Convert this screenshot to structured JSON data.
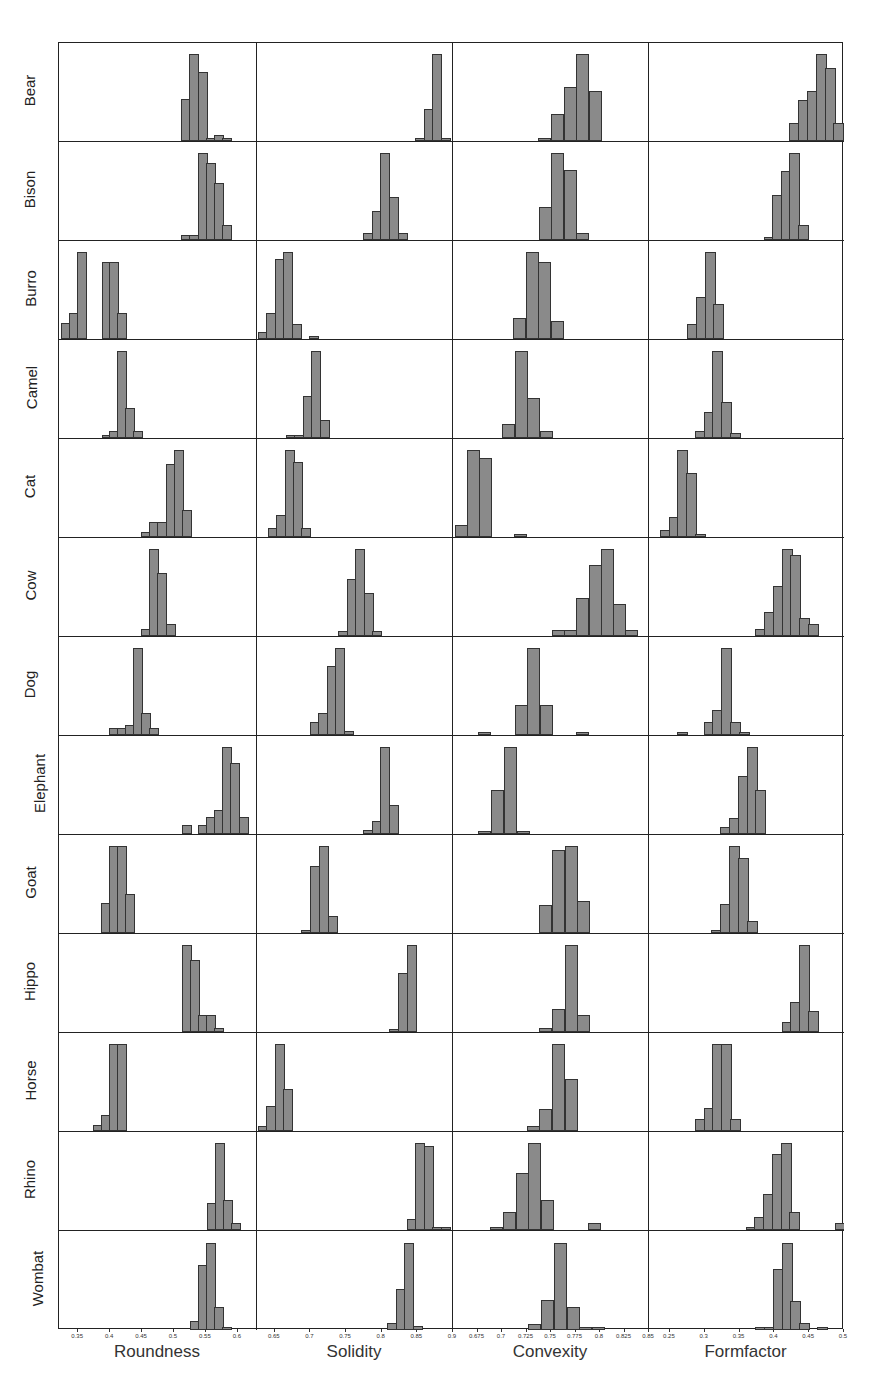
{
  "chart_data": {
    "type": "histogram-grid",
    "title": "",
    "rows": [
      "Bear",
      "Bison",
      "Burro",
      "Camel",
      "Cat",
      "Cow",
      "Dog",
      "Elephant",
      "Goat",
      "Hippo",
      "Horse",
      "Rhino",
      "Wombat"
    ],
    "columns": [
      {
        "name": "Roundness",
        "xlabel": "Roundness",
        "xlim": [
          0.32,
          0.63
        ],
        "ticks": [
          0.35,
          0.4,
          0.45,
          0.5,
          0.55,
          0.6
        ],
        "tick_labels": [
          "0.35",
          "0.4",
          "0.45",
          "0.5",
          "0.55",
          "0.6"
        ]
      },
      {
        "name": "Solidity",
        "xlabel": "Solidity",
        "xlim": [
          0.625,
          0.9
        ],
        "ticks": [
          0.65,
          0.7,
          0.75,
          0.8,
          0.85,
          0.9
        ],
        "tick_labels": [
          "0.65",
          "0.7",
          "0.75",
          "0.8",
          "0.85",
          "0.9"
        ]
      },
      {
        "name": "Convexity",
        "xlabel": "Convexity",
        "xlim": [
          0.65,
          0.85
        ],
        "ticks": [
          0.675,
          0.7,
          0.725,
          0.75,
          0.775,
          0.8,
          0.825,
          0.85
        ],
        "tick_labels": [
          "0.675",
          "0.7",
          "0.725",
          "0.75",
          "0.775",
          "0.8",
          "0.825",
          "0.85"
        ]
      },
      {
        "name": "Formfactor",
        "xlabel": "Formfactor",
        "xlim": [
          0.22,
          0.5
        ],
        "ticks": [
          0.25,
          0.3,
          0.35,
          0.4,
          0.45,
          0.5
        ],
        "tick_labels": [
          "0.25",
          "0.3",
          "0.35",
          "0.4",
          "0.45",
          "0.5"
        ]
      }
    ],
    "bin_width_px": 8,
    "note": "Each histogram listed as bars: [left-x fraction of panel width, relative height 0-1]",
    "histograms": {
      "Bear": [
        [
          [
            0.617,
            0.48
          ],
          [
            0.658,
            1.0
          ],
          [
            0.7,
            0.79
          ],
          [
            0.742,
            0.04
          ],
          [
            0.783,
            0.07
          ],
          [
            0.825,
            0.04
          ]
        ],
        [
          [
            0.805,
            0.04
          ],
          [
            0.85,
            0.37
          ],
          [
            0.895,
            1.0
          ],
          [
            0.94,
            0.04
          ]
        ],
        [
          [
            0.435,
            0.04
          ],
          [
            0.5,
            0.31
          ],
          [
            0.565,
            0.62
          ],
          [
            0.63,
            1.0
          ],
          [
            0.695,
            0.58
          ]
        ],
        [
          [
            0.72,
            0.21
          ],
          [
            0.765,
            0.47
          ],
          [
            0.81,
            0.58
          ],
          [
            0.855,
            1.0
          ],
          [
            0.9,
            0.84
          ],
          [
            0.945,
            0.21
          ]
        ]
      ],
      "Bison": [
        [
          [
            0.617,
            0.06
          ],
          [
            0.658,
            0.06
          ],
          [
            0.7,
            1.0
          ],
          [
            0.742,
            0.88
          ],
          [
            0.783,
            0.65
          ],
          [
            0.825,
            0.17
          ]
        ],
        [
          [
            0.54,
            0.08
          ],
          [
            0.585,
            0.33
          ],
          [
            0.63,
            1.0
          ],
          [
            0.675,
            0.49
          ],
          [
            0.72,
            0.08
          ]
        ],
        [
          [
            0.44,
            0.38
          ],
          [
            0.5,
            1.0
          ],
          [
            0.565,
            0.81
          ],
          [
            0.63,
            0.08
          ]
        ],
        [
          [
            0.59,
            0.04
          ],
          [
            0.633,
            0.52
          ],
          [
            0.676,
            0.79
          ],
          [
            0.719,
            1.0
          ],
          [
            0.762,
            0.17
          ]
        ]
      ],
      "Burro": [
        [
          [
            0.01,
            0.18
          ],
          [
            0.05,
            0.3
          ],
          [
            0.09,
            1.0
          ],
          [
            0.215,
            0.89
          ],
          [
            0.255,
            0.89
          ],
          [
            0.295,
            0.3
          ]
        ],
        [
          [
            0.005,
            0.08
          ],
          [
            0.048,
            0.3
          ],
          [
            0.091,
            0.92
          ],
          [
            0.134,
            1.0
          ],
          [
            0.177,
            0.17
          ],
          [
            0.267,
            0.04
          ]
        ],
        [
          [
            0.305,
            0.24
          ],
          [
            0.37,
            1.0
          ],
          [
            0.435,
            0.89
          ],
          [
            0.5,
            0.21
          ]
        ],
        [
          [
            0.195,
            0.17
          ],
          [
            0.24,
            0.48
          ],
          [
            0.285,
            1.0
          ],
          [
            0.33,
            0.4
          ]
        ]
      ],
      "Camel": [
        [
          [
            0.215,
            0.04
          ],
          [
            0.255,
            0.08
          ],
          [
            0.295,
            1.0
          ],
          [
            0.335,
            0.35
          ],
          [
            0.375,
            0.08
          ]
        ],
        [
          [
            0.148,
            0.04
          ],
          [
            0.191,
            0.04
          ],
          [
            0.234,
            0.48
          ],
          [
            0.277,
            1.0
          ],
          [
            0.32,
            0.21
          ]
        ],
        [
          [
            0.25,
            0.16
          ],
          [
            0.315,
            1.0
          ],
          [
            0.38,
            0.46
          ],
          [
            0.445,
            0.08
          ]
        ],
        [
          [
            0.235,
            0.08
          ],
          [
            0.28,
            0.3
          ],
          [
            0.325,
            1.0
          ],
          [
            0.37,
            0.41
          ],
          [
            0.415,
            0.06
          ]
        ]
      ],
      "Cat": [
        [
          [
            0.415,
            0.06
          ],
          [
            0.456,
            0.17
          ],
          [
            0.497,
            0.17
          ],
          [
            0.538,
            0.84
          ],
          [
            0.579,
            1.0
          ],
          [
            0.62,
            0.31
          ]
        ],
        [
          [
            0.055,
            0.1
          ],
          [
            0.098,
            0.25
          ],
          [
            0.141,
            1.0
          ],
          [
            0.184,
            0.86
          ],
          [
            0.227,
            0.1
          ]
        ],
        [
          [
            0.01,
            0.14
          ],
          [
            0.07,
            1.0
          ],
          [
            0.135,
            0.91
          ],
          [
            0.31,
            0.04
          ]
        ],
        [
          [
            0.055,
            0.08
          ],
          [
            0.1,
            0.23
          ],
          [
            0.145,
            1.0
          ],
          [
            0.19,
            0.74
          ],
          [
            0.235,
            0.04
          ]
        ]
      ],
      "Cow": [
        [
          [
            0.415,
            0.08
          ],
          [
            0.456,
            1.0
          ],
          [
            0.497,
            0.73
          ],
          [
            0.538,
            0.14
          ]
        ],
        [
          [
            0.415,
            0.06
          ],
          [
            0.458,
            0.66
          ],
          [
            0.501,
            1.0
          ],
          [
            0.544,
            0.5
          ],
          [
            0.587,
            0.06
          ]
        ],
        [
          [
            0.505,
            0.07
          ],
          [
            0.568,
            0.07
          ],
          [
            0.63,
            0.44
          ],
          [
            0.692,
            0.82
          ],
          [
            0.755,
            1.0
          ],
          [
            0.818,
            0.37
          ],
          [
            0.88,
            0.07
          ]
        ],
        [
          [
            0.545,
            0.08
          ],
          [
            0.59,
            0.28
          ],
          [
            0.635,
            0.57
          ],
          [
            0.68,
            1.0
          ],
          [
            0.725,
            0.93
          ],
          [
            0.77,
            0.21
          ],
          [
            0.815,
            0.14
          ]
        ]
      ],
      "Dog": [
        [
          [
            0.25,
            0.08
          ],
          [
            0.291,
            0.08
          ],
          [
            0.332,
            0.11
          ],
          [
            0.373,
            1.0
          ],
          [
            0.414,
            0.25
          ],
          [
            0.455,
            0.08
          ]
        ],
        [
          [
            0.27,
            0.15
          ],
          [
            0.313,
            0.25
          ],
          [
            0.356,
            0.79
          ],
          [
            0.399,
            1.0
          ],
          [
            0.442,
            0.05
          ]
        ],
        [
          [
            0.13,
            0.04
          ],
          [
            0.315,
            0.35
          ],
          [
            0.38,
            1.0
          ],
          [
            0.445,
            0.35
          ],
          [
            0.625,
            0.04
          ]
        ],
        [
          [
            0.145,
            0.04
          ],
          [
            0.28,
            0.15
          ],
          [
            0.325,
            0.29
          ],
          [
            0.37,
            1.0
          ],
          [
            0.415,
            0.15
          ],
          [
            0.46,
            0.04
          ]
        ]
      ],
      "Elephant": [
        [
          [
            0.62,
            0.1
          ],
          [
            0.702,
            0.1
          ],
          [
            0.743,
            0.19
          ],
          [
            0.784,
            0.28
          ],
          [
            0.825,
            1.0
          ],
          [
            0.866,
            0.82
          ],
          [
            0.907,
            0.19
          ]
        ],
        [
          [
            0.54,
            0.05
          ],
          [
            0.585,
            0.15
          ],
          [
            0.63,
            1.0
          ],
          [
            0.675,
            0.33
          ]
        ],
        [
          [
            0.13,
            0.04
          ],
          [
            0.195,
            0.51
          ],
          [
            0.26,
            1.0
          ],
          [
            0.325,
            0.04
          ]
        ],
        [
          [
            0.365,
            0.08
          ],
          [
            0.41,
            0.18
          ],
          [
            0.455,
            0.67
          ],
          [
            0.5,
            1.0
          ],
          [
            0.545,
            0.51
          ]
        ]
      ],
      "Goat": [
        [
          [
            0.21,
            0.34
          ],
          [
            0.251,
            1.0
          ],
          [
            0.292,
            1.0
          ],
          [
            0.333,
            0.45
          ]
        ],
        [
          [
            0.225,
            0.04
          ],
          [
            0.27,
            0.77
          ],
          [
            0.315,
            1.0
          ],
          [
            0.36,
            0.2
          ]
        ],
        [
          [
            0.44,
            0.32
          ],
          [
            0.505,
            0.95
          ],
          [
            0.57,
            1.0
          ],
          [
            0.635,
            0.37
          ]
        ],
        [
          [
            0.32,
            0.04
          ],
          [
            0.365,
            0.33
          ],
          [
            0.41,
            1.0
          ],
          [
            0.455,
            0.86
          ],
          [
            0.5,
            0.14
          ]
        ]
      ],
      "Hippo": [
        [
          [
            0.62,
            1.0
          ],
          [
            0.661,
            0.83
          ],
          [
            0.702,
            0.19
          ],
          [
            0.743,
            0.19
          ],
          [
            0.784,
            0.05
          ]
        ],
        [
          [
            0.675,
            0.04
          ],
          [
            0.72,
            0.68
          ],
          [
            0.765,
            1.0
          ]
        ],
        [
          [
            0.44,
            0.05
          ],
          [
            0.505,
            0.27
          ],
          [
            0.57,
            1.0
          ],
          [
            0.635,
            0.19
          ]
        ],
        [
          [
            0.68,
            0.11
          ],
          [
            0.725,
            0.34
          ],
          [
            0.77,
            1.0
          ],
          [
            0.815,
            0.24
          ]
        ]
      ],
      "Horse": [
        [
          [
            0.17,
            0.07
          ],
          [
            0.211,
            0.18
          ],
          [
            0.252,
            1.0
          ],
          [
            0.293,
            1.0
          ]
        ],
        [
          [
            0.005,
            0.06
          ],
          [
            0.048,
            0.29
          ],
          [
            0.091,
            1.0
          ],
          [
            0.134,
            0.48
          ]
        ],
        [
          [
            0.375,
            0.06
          ],
          [
            0.44,
            0.25
          ],
          [
            0.505,
            1.0
          ],
          [
            0.57,
            0.6
          ]
        ],
        [
          [
            0.235,
            0.14
          ],
          [
            0.28,
            0.27
          ],
          [
            0.325,
            1.0
          ],
          [
            0.37,
            1.0
          ],
          [
            0.415,
            0.14
          ]
        ]
      ],
      "Rhino": [
        [
          [
            0.745,
            0.31
          ],
          [
            0.786,
            1.0
          ],
          [
            0.827,
            0.34
          ],
          [
            0.868,
            0.08
          ]
        ],
        [
          [
            0.765,
            0.13
          ],
          [
            0.808,
            1.0
          ],
          [
            0.851,
            0.97
          ],
          [
            0.894,
            0.04
          ],
          [
            0.937,
            0.04
          ]
        ],
        [
          [
            0.19,
            0.04
          ],
          [
            0.255,
            0.21
          ],
          [
            0.32,
            0.66
          ],
          [
            0.385,
            1.0
          ],
          [
            0.45,
            0.35
          ],
          [
            0.69,
            0.08
          ]
        ],
        [
          [
            0.495,
            0.04
          ],
          [
            0.54,
            0.15
          ],
          [
            0.585,
            0.41
          ],
          [
            0.63,
            0.87
          ],
          [
            0.675,
            1.0
          ],
          [
            0.72,
            0.21
          ],
          [
            0.955,
            0.08
          ]
        ]
      ],
      "Wombat": [
        [
          [
            0.66,
            0.1
          ],
          [
            0.701,
            0.75
          ],
          [
            0.742,
            1.0
          ],
          [
            0.783,
            0.27
          ],
          [
            0.824,
            0.04
          ]
        ],
        [
          [
            0.665,
            0.08
          ],
          [
            0.708,
            0.47
          ],
          [
            0.751,
            1.0
          ],
          [
            0.794,
            0.05
          ]
        ],
        [
          [
            0.385,
            0.07
          ],
          [
            0.45,
            0.35
          ],
          [
            0.515,
            1.0
          ],
          [
            0.58,
            0.27
          ],
          [
            0.645,
            0.03
          ],
          [
            0.71,
            0.03
          ]
        ],
        [
          [
            0.545,
            0.03
          ],
          [
            0.59,
            0.03
          ],
          [
            0.635,
            0.7
          ],
          [
            0.68,
            1.0
          ],
          [
            0.725,
            0.33
          ],
          [
            0.77,
            0.08
          ],
          [
            0.86,
            0.04
          ]
        ]
      ]
    },
    "bar_color": "#8a8a8a",
    "grid": false
  }
}
